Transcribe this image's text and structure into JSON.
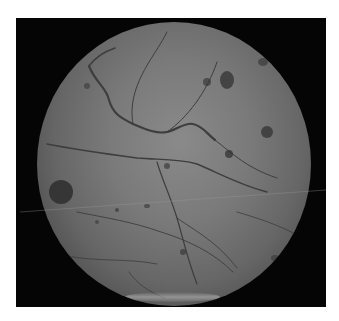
{
  "image": {
    "subject": "retinal fundus photograph (grayscale)",
    "background_color": "#ffffff",
    "frame_color": "#050505",
    "retina_center_color": "#8a8a8a",
    "retina_edge_color": "#2a2a2a",
    "features": [
      "branching retinal blood vessels",
      "scattered dark hemorrhage spots",
      "large dark lesion at left edge",
      "bright glare reflection at bottom",
      "faint horizontal scan line artifact"
    ]
  }
}
